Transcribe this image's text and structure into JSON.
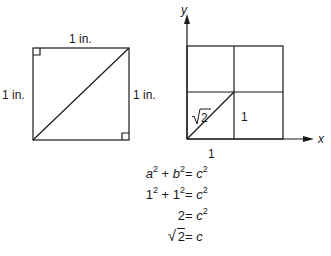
{
  "left_figure": {
    "top_label": "1 in.",
    "left_label": "1 in.",
    "right_label": "1 in."
  },
  "right_figure": {
    "y_axis_label": "y",
    "x_axis_label": "x",
    "diagonal_label_radicand": "2",
    "cell_label": "1",
    "bottom_label": "1"
  },
  "equations": [
    {
      "lhs_a": "a",
      "lhs_a_exp": "2",
      "plus": "+",
      "lhs_b": "b",
      "lhs_b_exp": "2",
      "eq": "=",
      "rhs": "c",
      "rhs_exp": "2"
    },
    {
      "lhs_a": "1",
      "lhs_a_exp": "2",
      "plus": "+",
      "lhs_b": "1",
      "lhs_b_exp": "2",
      "eq": "=",
      "rhs": "c",
      "rhs_exp": "2"
    },
    {
      "lhs": "2",
      "eq": "=",
      "rhs": "c",
      "rhs_exp": "2"
    },
    {
      "lhs_radicand": "2",
      "eq": "=",
      "rhs": "c"
    }
  ],
  "colors": {
    "stroke": "#1a1a1a",
    "background": "#ffffff"
  }
}
